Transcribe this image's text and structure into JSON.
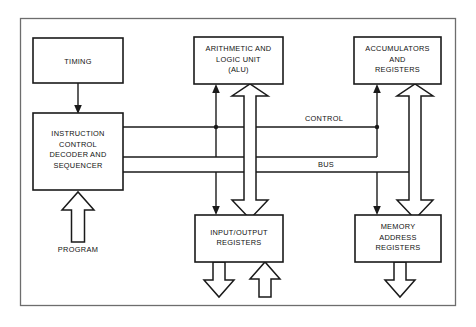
{
  "diagram": {
    "background_color": "#ffffff",
    "line_color": "#1a1a1a",
    "frame_color": "#6d6d6d",
    "blocks": [
      {
        "id": "timing",
        "lines": [
          "TIMING"
        ]
      },
      {
        "id": "instruction",
        "lines": [
          "INSTRUCTION",
          "CONTROL",
          "DECODER AND",
          "SEQUENCER"
        ]
      },
      {
        "id": "alu",
        "lines": [
          "ARITHMETIC AND",
          "LOGIC UNIT",
          "(ALU)"
        ]
      },
      {
        "id": "accumulators",
        "lines": [
          "ACCUMULATORS",
          "AND",
          "REGISTERS"
        ]
      },
      {
        "id": "io",
        "lines": [
          "INPUT/OUTPUT",
          "REGISTERS"
        ]
      },
      {
        "id": "memory",
        "lines": [
          "MEMORY",
          "ADDRESS",
          "REGISTERS"
        ]
      }
    ],
    "wire_labels": {
      "control": "CONTROL",
      "bus": "BUS",
      "program": "PROGRAM"
    }
  }
}
